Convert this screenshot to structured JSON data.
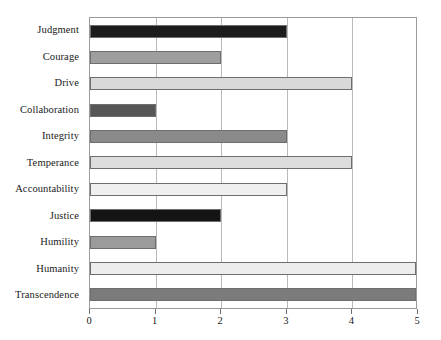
{
  "chart_data": {
    "type": "bar",
    "orientation": "horizontal",
    "title": "",
    "subtitle": "",
    "xlabel": "",
    "ylabel": "",
    "xlim": [
      0,
      5
    ],
    "ylim": null,
    "grid": true,
    "legend": null,
    "xticks": [
      "0",
      "1",
      "2",
      "3",
      "4",
      "5"
    ],
    "categories": [
      "Judgment",
      "Courage",
      "Drive",
      "Collaboration",
      "Integrity",
      "Temperance",
      "Accountability",
      "Justice",
      "Humility",
      "Humanity",
      "Transcendence"
    ],
    "values": [
      3,
      2,
      4,
      1,
      3,
      4,
      3,
      2,
      1,
      5,
      5
    ],
    "bar_colors": [
      "#1c1c1c",
      "#9e9e9e",
      "#d9d9d9",
      "#565656",
      "#8a8a8a",
      "#dcdcdc",
      "#efefef",
      "#141414",
      "#9b9b9b",
      "#ededed",
      "#7b7b7b"
    ],
    "bar_edge_color": "#6e6e6e",
    "axis_color": "#9a9a9a",
    "gridline_color": "#b9b9b9",
    "background_color": "#ffffff",
    "text_color": "#1a1a1a"
  }
}
